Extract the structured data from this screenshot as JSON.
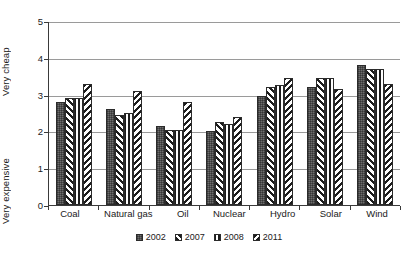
{
  "chart_data": {
    "type": "bar",
    "title": "",
    "xlabel": "",
    "ylabel": "Very expensive — Very cheap",
    "ylim": [
      0,
      5
    ],
    "yticks": [
      0,
      1,
      2,
      3,
      4,
      5
    ],
    "grid": true,
    "legend_position": "bottom",
    "axis_label_top": "Very cheap",
    "axis_label_bottom": "Very expensive",
    "categories": [
      "Coal",
      "Natural gas",
      "Oil",
      "Nuclear",
      "Hydro",
      "Solar",
      "Wind"
    ],
    "series": [
      {
        "name": "2002",
        "pattern": "solid-dark-gray",
        "values": [
          2.8,
          2.6,
          2.15,
          2.0,
          2.95,
          3.2,
          3.8
        ]
      },
      {
        "name": "2007",
        "pattern": "forward-diagonal-hatch",
        "values": [
          2.9,
          2.45,
          2.05,
          2.25,
          3.2,
          3.45,
          3.7
        ]
      },
      {
        "name": "2008",
        "pattern": "vertical-stripes",
        "values": [
          2.9,
          2.5,
          2.05,
          2.2,
          3.25,
          3.45,
          3.7
        ]
      },
      {
        "name": "2011",
        "pattern": "back-diagonal-hatch",
        "values": [
          3.3,
          3.1,
          2.8,
          2.4,
          3.45,
          3.15,
          3.3
        ]
      }
    ]
  },
  "colors": {
    "series_2002": "#6e6e6e",
    "series_2007": "#1d1d1d",
    "series_2008": "#1d1d1d",
    "series_2011": "#1d1d1d",
    "gridline": "#9a9a9a",
    "axis": "#3a3a3a",
    "background": "#ffffff"
  }
}
